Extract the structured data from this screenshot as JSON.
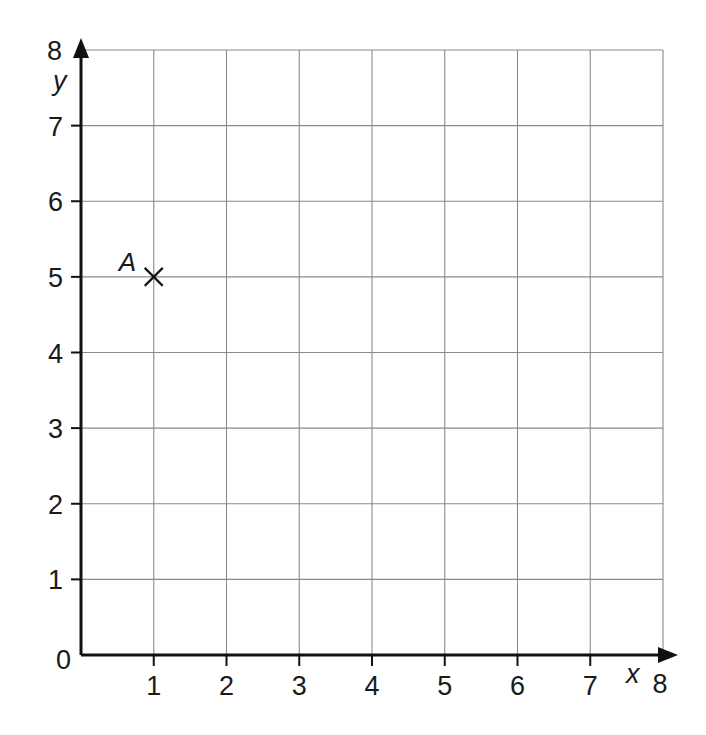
{
  "chart_data": {
    "type": "scatter",
    "title": "",
    "xlabel": "x",
    "ylabel": "y",
    "xlim": [
      0,
      8
    ],
    "ylim": [
      0,
      8
    ],
    "grid": true,
    "x_ticks": [
      "0",
      "1",
      "2",
      "3",
      "4",
      "5",
      "6",
      "7",
      "8"
    ],
    "y_ticks": [
      "0",
      "1",
      "2",
      "3",
      "4",
      "5",
      "6",
      "7",
      "8"
    ],
    "points": [
      {
        "label": "A",
        "x": 1,
        "y": 5,
        "marker": "cross"
      }
    ]
  },
  "axes": {
    "x_label": "x",
    "y_label": "y",
    "origin_label": "0"
  },
  "colors": {
    "grid": "#8a8a8a",
    "axis": "#111111",
    "text": "#1a1a1a"
  }
}
